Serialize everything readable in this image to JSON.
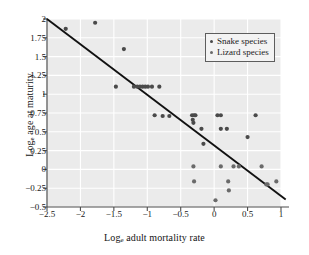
{
  "chart_data": {
    "type": "scatter",
    "title": "",
    "xlabel": "Log",
    "xlabel_sub": "e",
    "xlabel_rest": " adult mortality rate",
    "ylabel": "Log",
    "ylabel_sub": "e",
    "ylabel_rest": " age at maturity",
    "xlim": [
      -2.5,
      1.0
    ],
    "ylim": [
      -0.5,
      2.0
    ],
    "xticks": [
      "-2.5",
      "-2",
      "-1.5",
      "-1",
      "-0.5",
      "0",
      "0.5",
      "1"
    ],
    "xtick_values": [
      -2.5,
      -2,
      -1.5,
      -1,
      -0.5,
      0,
      0.5,
      1
    ],
    "yticks": [
      "2",
      "1.75",
      "1.5",
      "1.25",
      "1",
      "0.75",
      "0.5",
      "0.25",
      "0",
      "-0.25",
      "-0.5"
    ],
    "ytick_values": [
      2,
      1.75,
      1.5,
      1.25,
      1,
      0.75,
      0.5,
      0.25,
      0,
      -0.25,
      -0.5
    ],
    "grid": true,
    "grid_color": "#ffffff",
    "plot_background": "#ebebeb",
    "point_color": "#4a4a4a",
    "line_color": "#111111",
    "legend_position": "top-right",
    "series": [
      {
        "name": "Snake species",
        "marker_color": "#4a4a4a",
        "points": [
          [
            -2.22,
            1.87
          ],
          [
            -1.78,
            1.95
          ],
          [
            -1.35,
            1.6
          ],
          [
            -1.47,
            1.1
          ],
          [
            -1.2,
            1.1
          ],
          [
            -1.15,
            1.1
          ],
          [
            -1.11,
            1.1
          ],
          [
            -1.07,
            1.1
          ],
          [
            -1.03,
            1.1
          ],
          [
            -0.99,
            1.1
          ],
          [
            -0.93,
            1.1
          ],
          [
            -0.82,
            1.1
          ],
          [
            -0.89,
            0.72
          ],
          [
            -0.77,
            0.71
          ],
          [
            -0.67,
            0.71
          ],
          [
            -0.33,
            0.72
          ],
          [
            -0.3,
            0.72
          ],
          [
            -0.28,
            0.72
          ],
          [
            -0.32,
            0.66
          ],
          [
            -0.31,
            0.62
          ],
          [
            -0.19,
            0.54
          ],
          [
            -0.16,
            0.34
          ],
          [
            0.05,
            0.72
          ],
          [
            0.1,
            0.72
          ],
          [
            0.1,
            0.54
          ],
          [
            0.19,
            0.54
          ],
          [
            0.5,
            0.43
          ],
          [
            0.62,
            0.72
          ]
        ]
      },
      {
        "name": "Lizard species",
        "marker_color": "#6a6a6a",
        "points": [
          [
            -0.31,
            0.04
          ],
          [
            -0.3,
            -0.16
          ],
          [
            0.02,
            -0.41
          ],
          [
            0.1,
            0.04
          ],
          [
            0.21,
            -0.16
          ],
          [
            0.22,
            -0.28
          ],
          [
            0.29,
            0.04
          ],
          [
            0.37,
            0.04
          ],
          [
            0.71,
            0.04
          ],
          [
            0.78,
            -0.2
          ],
          [
            0.8,
            -0.2
          ],
          [
            0.93,
            -0.16
          ]
        ]
      }
    ],
    "regression_line": {
      "x_start": -2.5,
      "y_start": 2.0,
      "x_end": 1.07,
      "y_end": -0.4
    },
    "legend_entries": [
      "Snake species",
      "Lizard species"
    ]
  }
}
